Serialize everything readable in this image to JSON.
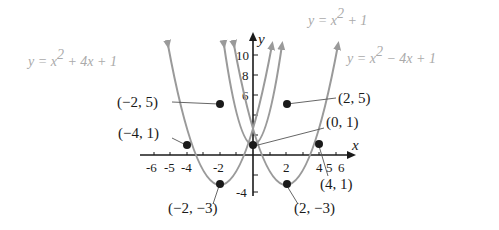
{
  "diagram": {
    "type": "coordinate-graph",
    "axes": {
      "x_label": "x",
      "y_label": "y",
      "x_ticks": [
        "-6",
        "-5",
        "-4",
        "-2",
        "2",
        "4",
        "5",
        "6"
      ],
      "y_ticks": [
        "10",
        "8",
        "6",
        "-4"
      ]
    },
    "equations": [
      {
        "id": "left",
        "text_y": "y = x",
        "exp": "2",
        "rest": " + 4x + 1"
      },
      {
        "id": "center",
        "text_y": "y = x",
        "exp": "2",
        "rest": " + 1"
      },
      {
        "id": "right",
        "text_y": "y = x",
        "exp": "2",
        "rest": " − 4x + 1"
      }
    ],
    "points": [
      {
        "label": "(−2, 5)",
        "x": -2,
        "y": 5
      },
      {
        "label": "(2, 5)",
        "x": 2,
        "y": 5
      },
      {
        "label": "(0, 1)",
        "x": 0,
        "y": 1
      },
      {
        "label": "(−4, 1)",
        "x": -4,
        "y": 1
      },
      {
        "label": "(4, 1)",
        "x": 4,
        "y": 1
      },
      {
        "label": "(−2, −3)",
        "x": -2,
        "y": -3
      },
      {
        "label": "(2, −3)",
        "x": 2,
        "y": -3
      }
    ],
    "colors": {
      "curve": "#9a9a9a",
      "axis": "#1a1a1a",
      "point": "#1a1a1a",
      "equation": "#aaaaaa"
    }
  }
}
